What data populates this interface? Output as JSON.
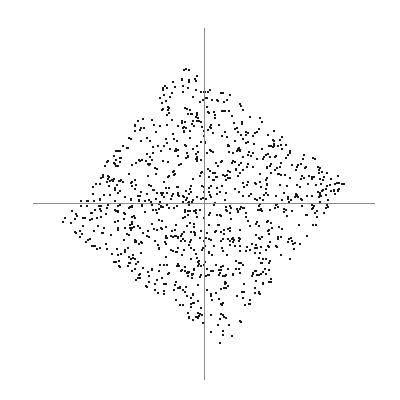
{
  "figure": {
    "title": "",
    "background_color": "#ffffff",
    "width": 400,
    "height": 400
  },
  "axes": {
    "origin_x": 204,
    "origin_y": 203,
    "color": "#8c8c8c",
    "line_width": 1,
    "x_axis": {
      "name": "horizontal-axis",
      "start_px": 33,
      "end_px": 375,
      "label": ""
    },
    "y_axis": {
      "name": "vertical-axis",
      "start_px": 28,
      "end_px": 380,
      "label": ""
    },
    "ticks_visible": false,
    "grid": false,
    "frame": false
  },
  "chart_data": {
    "type": "scatter",
    "title": "",
    "xlabel": "",
    "ylabel": "",
    "xlim": [
      -1.25,
      1.25
    ],
    "ylim": [
      -1.25,
      1.25
    ],
    "grid": false,
    "legend": null,
    "marker": {
      "shape": "square",
      "size_px": 2,
      "color": "#1a1a1a",
      "edge_color": "#1a1a1a",
      "opacity": 1
    },
    "n_points": 1100,
    "distribution": "uniform-in-rotated-diamond",
    "shape_description": "Points fill a diamond (rhombus) region defined by the L1 norm |x| + |y| <= 1, rotated slightly counter-clockwise so the upper apex sits left of the vertical axis and the lower apex sits right of it.",
    "boundary": {
      "norm": "L1",
      "radius": 1.0,
      "rotation_deg": 8
    },
    "pixel_extent": {
      "x_min": 60,
      "x_max": 348,
      "y_min": 58,
      "y_max": 358
    },
    "apexes_px": {
      "top": [
        170,
        58
      ],
      "right": [
        348,
        178
      ],
      "bottom": [
        232,
        358
      ],
      "left": [
        60,
        228
      ]
    },
    "scale_px_per_unit": 145,
    "random_seed": 20240613
  }
}
